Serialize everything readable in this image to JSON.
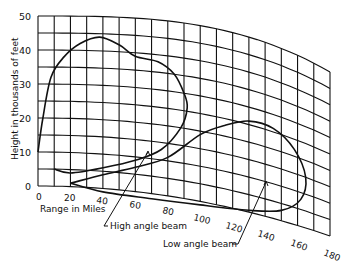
{
  "chart_data": {
    "type": "line",
    "title": "",
    "xlabel": "Range in Miles",
    "ylabel": "Height in thousands of feet",
    "x_ticks": [
      0,
      20,
      40,
      60,
      80,
      100,
      120,
      140,
      160,
      180
    ],
    "y_ticks": [
      0,
      10,
      20,
      30,
      40,
      50
    ],
    "xlim": [
      0,
      180
    ],
    "ylim": [
      0,
      50
    ],
    "grid": "curved earth-curvature grid, 10-mile range lines, 5000-ft height lines",
    "series": [
      {
        "name": "High angle beam",
        "annotation": "High angle beam",
        "points": [
          [
            0,
            10
          ],
          [
            3,
            20
          ],
          [
            8,
            32
          ],
          [
            16,
            38
          ],
          [
            26,
            42
          ],
          [
            38,
            44
          ],
          [
            50,
            42
          ],
          [
            60,
            39
          ],
          [
            74,
            38
          ],
          [
            84,
            35
          ],
          [
            90,
            30
          ],
          [
            92,
            26
          ],
          [
            88,
            20
          ],
          [
            76,
            13
          ],
          [
            60,
            9
          ],
          [
            40,
            6
          ],
          [
            20,
            4
          ],
          [
            10,
            5
          ]
        ]
      },
      {
        "name": "Low angle beam",
        "annotation": "Low angle beam",
        "points": [
          [
            20,
            1
          ],
          [
            40,
            4
          ],
          [
            60,
            7
          ],
          [
            80,
            11
          ],
          [
            100,
            19
          ],
          [
            115,
            23
          ],
          [
            130,
            26
          ],
          [
            145,
            26
          ],
          [
            158,
            22
          ],
          [
            165,
            15
          ],
          [
            162,
            8
          ],
          [
            150,
            3
          ],
          [
            130,
            0.5
          ],
          [
            100,
            -1
          ],
          [
            70,
            -1.5
          ],
          [
            40,
            -1
          ],
          [
            20,
            1
          ]
        ]
      }
    ]
  },
  "labels": {
    "y_title": "Height in thousands of feet",
    "x_title": "Range in Miles",
    "y_ticks": [
      "0",
      "10",
      "20",
      "30",
      "40",
      "50"
    ],
    "x_ticks": [
      "0",
      "20",
      "40",
      "60",
      "80",
      "100",
      "120",
      "140",
      "160",
      "180"
    ],
    "high_beam": "High angle beam",
    "low_beam": "Low angle beam"
  }
}
